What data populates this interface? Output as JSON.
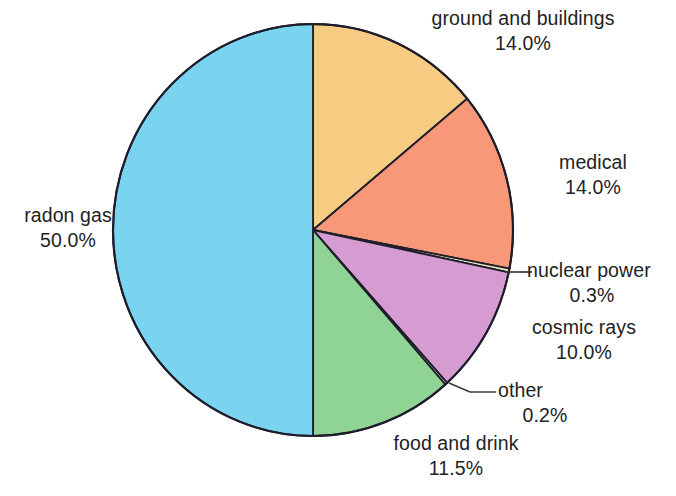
{
  "chart_data": {
    "type": "pie",
    "title": "",
    "subtitle": "",
    "xlabel": "",
    "ylabel": "",
    "legend_position": "none",
    "grid": false,
    "units": "%",
    "start_angle_deg": 0,
    "direction": "clockwise",
    "categories": [
      "ground and buildings",
      "medical",
      "nuclear power",
      "cosmic rays",
      "other",
      "food and drink",
      "radon gas"
    ],
    "values": [
      14.0,
      14.0,
      0.3,
      10.0,
      0.2,
      11.5,
      50.0
    ],
    "value_labels": [
      "14.0%",
      "14.0%",
      "0.3%",
      "10.0%",
      "0.2%",
      "11.5%",
      "50.0%"
    ],
    "colors": [
      "#f8cb83",
      "#f89878",
      "#f2e7c0",
      "#d69bd0",
      "#cfe6cf",
      "#8fd494",
      "#7ad4f0"
    ],
    "slices": [
      {
        "id": "ground-and-buildings",
        "label": "ground and buildings",
        "value": 14.0,
        "value_label": "14.0%",
        "color": "#f8cb83",
        "start_pct": 0.0,
        "end_pct": 14.0,
        "leader": false
      },
      {
        "id": "medical",
        "label": "medical",
        "value": 14.0,
        "value_label": "14.0%",
        "color": "#f89878",
        "start_pct": 14.0,
        "end_pct": 28.0,
        "leader": false
      },
      {
        "id": "nuclear-power",
        "label": "nuclear power",
        "value": 0.3,
        "value_label": "0.3%",
        "color": "#f2e7c0",
        "start_pct": 28.0,
        "end_pct": 28.3,
        "leader": true
      },
      {
        "id": "cosmic-rays",
        "label": "cosmic rays",
        "value": 10.0,
        "value_label": "10.0%",
        "color": "#d69bd0",
        "start_pct": 28.3,
        "end_pct": 38.3,
        "leader": false
      },
      {
        "id": "other",
        "label": "other",
        "value": 0.2,
        "value_label": "0.2%",
        "color": "#cfe6cf",
        "start_pct": 38.3,
        "end_pct": 38.5,
        "leader": true
      },
      {
        "id": "food-and-drink",
        "label": "food and drink",
        "value": 11.5,
        "value_label": "11.5%",
        "color": "#8fd494",
        "start_pct": 38.5,
        "end_pct": 50.0,
        "leader": false
      },
      {
        "id": "radon-gas",
        "label": "radon gas",
        "value": 50.0,
        "value_label": "50.0%",
        "color": "#7ad4f0",
        "start_pct": 50.0,
        "end_pct": 100.0,
        "leader": false
      }
    ],
    "total": 100.0,
    "outline_color": "#1d1d2b"
  },
  "labels": {
    "ground": {
      "name": "ground and buildings",
      "value": "14.0%"
    },
    "medical": {
      "name": "medical",
      "value": "14.0%"
    },
    "nuclear": {
      "name": "nuclear power",
      "value": "0.3%"
    },
    "cosmic": {
      "name": "cosmic rays",
      "value": "10.0%"
    },
    "other": {
      "name": "other",
      "value": "0.2%"
    },
    "food": {
      "name": "food and drink",
      "value": "11.5%"
    },
    "radon": {
      "name": "radon gas",
      "value": "50.0%"
    }
  }
}
